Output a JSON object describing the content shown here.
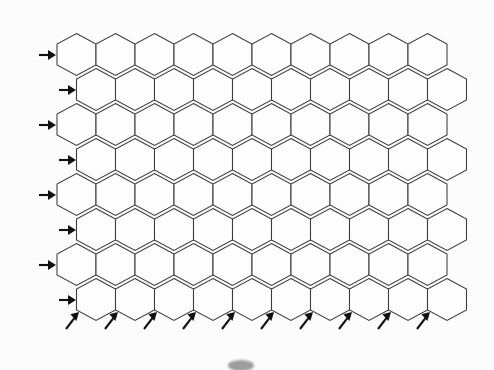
{
  "diagram": {
    "background_color": "#fcfcfc",
    "stroke_color": "#3a3a3a",
    "label_color": "#111111",
    "grid": {
      "type": "hexagonal",
      "orientation": "pointy-top",
      "columns": 10,
      "rows": 8,
      "hex_width": 39,
      "hex_height": 42,
      "row_pitch": 35,
      "odd_row_offset": 19.5,
      "origin_x": 57,
      "origin_y": 310
    },
    "row_labels": [
      {
        "label": "8",
        "arrow": "right-arrow"
      },
      {
        "label": "7",
        "arrow": "right-arrow"
      },
      {
        "label": "6",
        "arrow": "right-arrow"
      },
      {
        "label": "5",
        "arrow": "right-arrow"
      },
      {
        "label": "4",
        "arrow": "right-arrow"
      },
      {
        "label": "3",
        "arrow": "right-arrow"
      },
      {
        "label": "2",
        "arrow": "right-arrow"
      },
      {
        "label": "1",
        "arrow": "right-arrow"
      }
    ],
    "column_labels": [
      {
        "label": "A",
        "arrow": "up-right-arrow"
      },
      {
        "label": "B",
        "arrow": "up-right-arrow"
      },
      {
        "label": "C",
        "arrow": "up-right-arrow"
      },
      {
        "label": "D",
        "arrow": "up-right-arrow"
      },
      {
        "label": "E",
        "arrow": "up-right-arrow"
      },
      {
        "label": "F",
        "arrow": "up-right-arrow"
      },
      {
        "label": "G",
        "arrow": "up-right-arrow"
      },
      {
        "label": "H",
        "arrow": "up-right-arrow"
      },
      {
        "label": "I",
        "arrow": "up-right-arrow"
      },
      {
        "label": "J",
        "arrow": "up-right-arrow"
      }
    ]
  }
}
